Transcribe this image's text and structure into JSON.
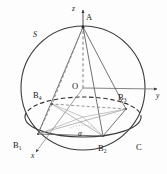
{
  "figure": {
    "background_color": "#fdfdfd",
    "stroke_color": "#3a3a3a",
    "light_stroke_color": "#8a8a8a",
    "label_color": "#1a1a1a",
    "width": 167,
    "height": 174
  },
  "labels": {
    "sphere": "S",
    "apex": "A",
    "center": "O",
    "base_circle": "C",
    "angle": "α",
    "axis_x": "x",
    "axis_y": "y",
    "axis_z": "z",
    "vertex_b1": "B",
    "vertex_b1_sub": "1",
    "vertex_b2": "B",
    "vertex_b2_sub": "2",
    "vertex_b3": "B",
    "vertex_b3_sub": "3",
    "vertex_b4": "B",
    "vertex_b4_sub": "4"
  },
  "geometry": {
    "sphere_center": {
      "x": 83,
      "y": 88
    },
    "sphere_radius": 62,
    "apex": {
      "x": 83,
      "y": 27
    },
    "base_ellipse": {
      "cx": 83,
      "cy": 117,
      "rx": 58,
      "ry": 20
    },
    "points": {
      "B1": {
        "x": 38,
        "y": 134
      },
      "B2": {
        "x": 103,
        "y": 136
      },
      "B3": {
        "x": 126,
        "y": 109
      },
      "B4": {
        "x": 52,
        "y": 104
      }
    },
    "axis_x_end": {
      "x": 37,
      "y": 153
    },
    "axis_y_end": {
      "x": 160,
      "y": 92
    },
    "axis_z_end": {
      "x": 83,
      "y": 8
    }
  }
}
